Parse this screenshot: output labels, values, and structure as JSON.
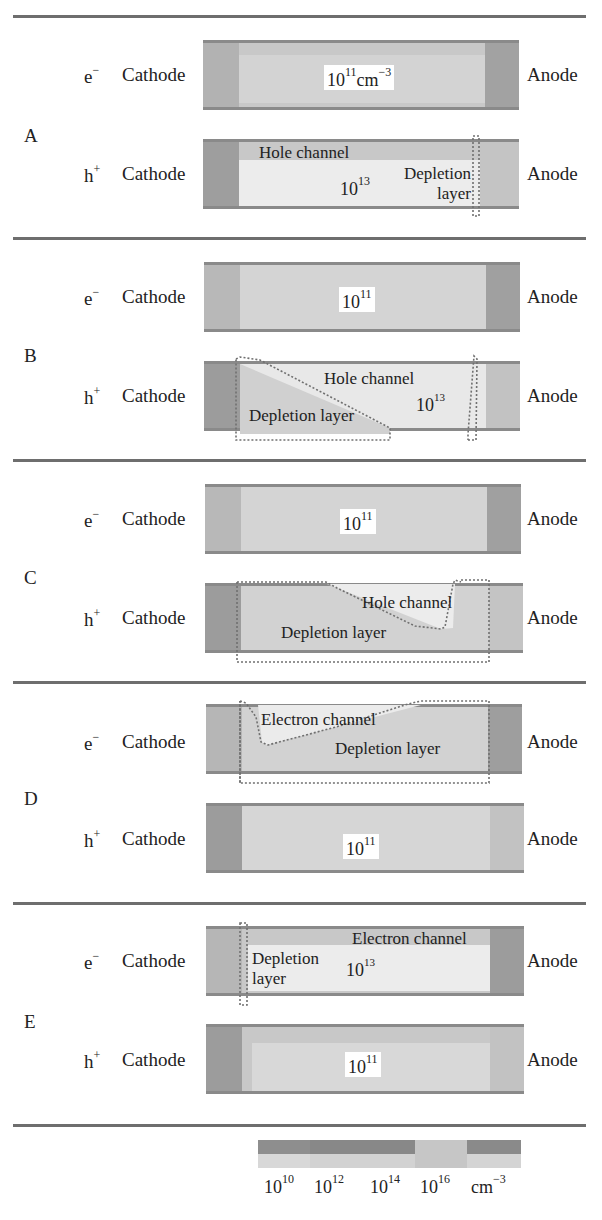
{
  "colors": {
    "separator": "#6e6e6e",
    "cathode_dark": "#9a9a9a",
    "anode_dark": "#a4a4a4",
    "bulk_light": "#d6d6d6",
    "channel_white": "#eeeeee",
    "box_border": "#8a8a8a",
    "dotted_outline": "#707070"
  },
  "panels": [
    {
      "label": "A",
      "rows": [
        {
          "carrier": "e",
          "carrier_sup": "−",
          "cathode": "Cathode",
          "anode": "Anode",
          "concentration_base": "10",
          "concentration_exp": "11",
          "concentration_unit": "cm",
          "concentration_unit_exp": "−3"
        },
        {
          "carrier": "h",
          "carrier_sup": "+",
          "cathode": "Cathode",
          "anode": "Anode",
          "concentration_base": "10",
          "concentration_exp": "13",
          "channel_label": "Hole channel",
          "depletion_label_1": "Depletion",
          "depletion_label_2": "layer"
        }
      ]
    },
    {
      "label": "B",
      "rows": [
        {
          "carrier": "e",
          "carrier_sup": "−",
          "cathode": "Cathode",
          "anode": "Anode",
          "concentration_base": "10",
          "concentration_exp": "11"
        },
        {
          "carrier": "h",
          "carrier_sup": "+",
          "cathode": "Cathode",
          "anode": "Anode",
          "concentration_base": "10",
          "concentration_exp": "13",
          "channel_label": "Hole channel",
          "depletion_label": "Depletion layer"
        }
      ]
    },
    {
      "label": "C",
      "rows": [
        {
          "carrier": "e",
          "carrier_sup": "−",
          "cathode": "Cathode",
          "anode": "Anode",
          "concentration_base": "10",
          "concentration_exp": "11"
        },
        {
          "carrier": "h",
          "carrier_sup": "+",
          "cathode": "Cathode",
          "anode": "Anode",
          "channel_label": "Hole channel",
          "depletion_label": "Depletion layer"
        }
      ]
    },
    {
      "label": "D",
      "rows": [
        {
          "carrier": "e",
          "carrier_sup": "−",
          "cathode": "Cathode",
          "anode": "Anode",
          "channel_label": "Electron channel",
          "depletion_label": "Depletion layer"
        },
        {
          "carrier": "h",
          "carrier_sup": "+",
          "cathode": "Cathode",
          "anode": "Anode",
          "concentration_base": "10",
          "concentration_exp": "11"
        }
      ]
    },
    {
      "label": "E",
      "rows": [
        {
          "carrier": "e",
          "carrier_sup": "−",
          "cathode": "Cathode",
          "anode": "Anode",
          "concentration_base": "10",
          "concentration_exp": "13",
          "channel_label": "Electron channel",
          "depletion_label_1": "Depletion",
          "depletion_label_2": "layer"
        },
        {
          "carrier": "h",
          "carrier_sup": "+",
          "cathode": "Cathode",
          "anode": "Anode",
          "concentration_base": "10",
          "concentration_exp": "11"
        }
      ]
    }
  ],
  "colorbar": {
    "ticks": [
      {
        "base": "10",
        "exp": "10"
      },
      {
        "base": "10",
        "exp": "12"
      },
      {
        "base": "10",
        "exp": "14"
      },
      {
        "base": "10",
        "exp": "16"
      }
    ],
    "unit": "cm",
    "unit_exp": "−3"
  }
}
